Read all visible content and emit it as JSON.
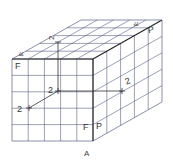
{
  "figure": {
    "caption": "A",
    "grid_divisions": 5,
    "labels": {
      "front_top_left": "F",
      "front_bottom_right_f": "F",
      "right_bottom_left_p": "P",
      "top_front_left": "F",
      "top_back_right_f": "F",
      "top_back_right_p": "P",
      "top_center": "2",
      "front_center": "2",
      "front_axis_end": "2",
      "right_center": "2"
    },
    "colors": {
      "grid": "#5a5f8a",
      "edge": "#222222",
      "text": "#333333"
    }
  }
}
